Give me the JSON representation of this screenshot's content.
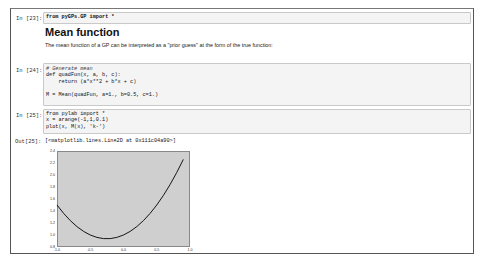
{
  "cells": [
    {
      "type": "code",
      "prompt": "In [23]:",
      "lines": [
        "from pyGPs.GP import *"
      ]
    },
    {
      "type": "markdown",
      "title": "Mean function",
      "text": "The mean function of a GP can be interpreted as a \"prior guess\" at the form of the true function:"
    },
    {
      "type": "code",
      "prompt": "In [24]:",
      "lines": [
        "# Generate mean",
        "def quadFun(x, a, b, c):",
        "    return (a*x**2 + b*x + c)",
        "",
        "M = Mean(quadFun, a=1., b=0.5, c=1.)"
      ]
    },
    {
      "type": "code",
      "prompt": "In [25]:",
      "lines": [
        "from pylab import *",
        "x = arange(-1,1,0.1)",
        "plot(x, M(x), 'k-')"
      ],
      "output_prompt": "Out[25]:",
      "output_text": "[<matplotlib.lines.Line2D at 0x111c04a90>]"
    }
  ],
  "chart_data": {
    "type": "line",
    "title": "",
    "xlabel": "",
    "ylabel": "",
    "xlim": [
      -1.0,
      1.0
    ],
    "ylim": [
      0.8,
      2.4
    ],
    "x_ticks": [
      "-1.0",
      "-0.5",
      "0.0",
      "0.5",
      "1.0"
    ],
    "y_ticks": [
      "0.8",
      "1.0",
      "1.2",
      "1.4",
      "1.6",
      "1.8",
      "2.0",
      "2.2",
      "2.4"
    ],
    "grid": false,
    "background": "#cfcfcf",
    "series": [
      {
        "name": "M(x)",
        "color": "#000000",
        "x": [
          -1.0,
          -0.9,
          -0.8,
          -0.7,
          -0.6,
          -0.5,
          -0.4,
          -0.3,
          -0.2,
          -0.1,
          0.0,
          0.1,
          0.2,
          0.3,
          0.4,
          0.5,
          0.6,
          0.7,
          0.8,
          0.9
        ],
        "values": [
          1.5,
          1.36,
          1.24,
          1.14,
          1.06,
          1.0,
          0.96,
          0.94,
          0.94,
          0.96,
          1.0,
          1.06,
          1.14,
          1.24,
          1.36,
          1.5,
          1.66,
          1.84,
          2.04,
          2.26
        ]
      }
    ]
  }
}
